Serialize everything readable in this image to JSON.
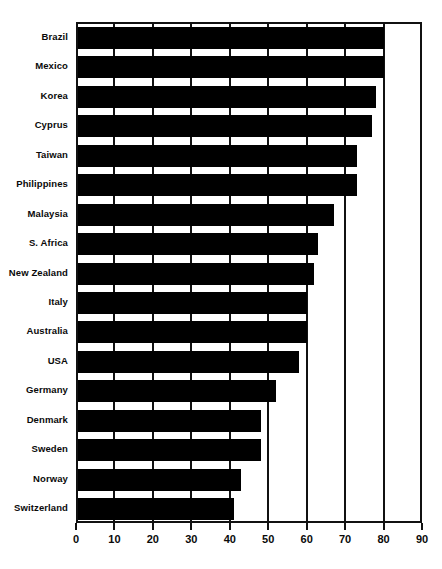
{
  "chart_data": {
    "type": "bar",
    "orientation": "horizontal",
    "title": "",
    "subtitle": "",
    "xlabel": "",
    "ylabel": "",
    "xlim": [
      0,
      90
    ],
    "ylim": null,
    "grid": true,
    "grid_axis": "x",
    "legend": false,
    "legend_position": "none",
    "bar_color": "#000000",
    "axis_color": "#111111",
    "background": "#ffffff",
    "xticks": [
      0,
      10,
      20,
      30,
      40,
      50,
      60,
      70,
      80,
      90
    ],
    "xtick_labels": [
      "0",
      "10",
      "20",
      "30",
      "40",
      "50",
      "60",
      "70",
      "80",
      "90"
    ],
    "categories": [
      "Brazil",
      "Mexico",
      "Korea",
      "Cyprus",
      "Taiwan",
      "Philippines",
      "Malaysia",
      "S. Africa",
      "New Zealand",
      "Italy",
      "Australia",
      "USA",
      "Germany",
      "Denmark",
      "Sweden",
      "Norway",
      "Switzerland"
    ],
    "values": [
      80,
      80,
      78,
      77,
      73,
      73,
      67,
      63,
      62,
      60,
      60,
      58,
      52,
      48,
      48,
      43,
      41
    ],
    "series": [
      {
        "name": "value",
        "values": [
          80,
          80,
          78,
          77,
          73,
          73,
          67,
          63,
          62,
          60,
          60,
          58,
          52,
          48,
          48,
          43,
          41
        ]
      }
    ]
  }
}
